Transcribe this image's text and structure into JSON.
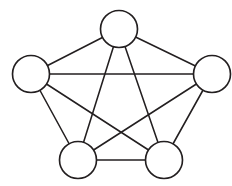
{
  "canvas": {
    "width": 232,
    "height": 186,
    "background_color": "#ffffff",
    "line_color": "#231f20",
    "node_fill_color": "#ffffff"
  },
  "diagram": {
    "title": "",
    "type": "graph",
    "graph_name": "K5",
    "vertex_count": 5,
    "edge_count": 10,
    "node_radius": 18.5,
    "edge_stroke_width": 1.55,
    "node_stroke_width": 1.65
  },
  "chart_data": {
    "type": "diagram",
    "title": "",
    "nodes": [
      {
        "id": "top",
        "label": "",
        "x": 119,
        "y": 29,
        "r": 18.5
      },
      {
        "id": "right",
        "label": "",
        "x": 212,
        "y": 74,
        "r": 18.5
      },
      {
        "id": "bottom-right",
        "label": "",
        "x": 164,
        "y": 160,
        "r": 18.5
      },
      {
        "id": "bottom-left",
        "label": "",
        "x": 78,
        "y": 160,
        "r": 18.5
      },
      {
        "id": "left",
        "label": "",
        "x": 31,
        "y": 74,
        "r": 18.5
      }
    ],
    "edges": [
      {
        "id": "e1",
        "from": "top",
        "to": "right",
        "kind": "outer"
      },
      {
        "id": "e2",
        "from": "right",
        "to": "bottom-right",
        "kind": "outer"
      },
      {
        "id": "e3",
        "from": "bottom-right",
        "to": "bottom-left",
        "kind": "outer"
      },
      {
        "id": "e4",
        "from": "bottom-left",
        "to": "left",
        "kind": "outer"
      },
      {
        "id": "e5",
        "from": "left",
        "to": "top",
        "kind": "outer"
      },
      {
        "id": "e6",
        "from": "top",
        "to": "bottom-right",
        "kind": "diagonal"
      },
      {
        "id": "e7",
        "from": "top",
        "to": "bottom-left",
        "kind": "diagonal"
      },
      {
        "id": "e8",
        "from": "right",
        "to": "bottom-left",
        "kind": "diagonal"
      },
      {
        "id": "e9",
        "from": "right",
        "to": "left",
        "kind": "diagonal"
      },
      {
        "id": "e10",
        "from": "bottom-right",
        "to": "left",
        "kind": "diagonal"
      }
    ]
  }
}
